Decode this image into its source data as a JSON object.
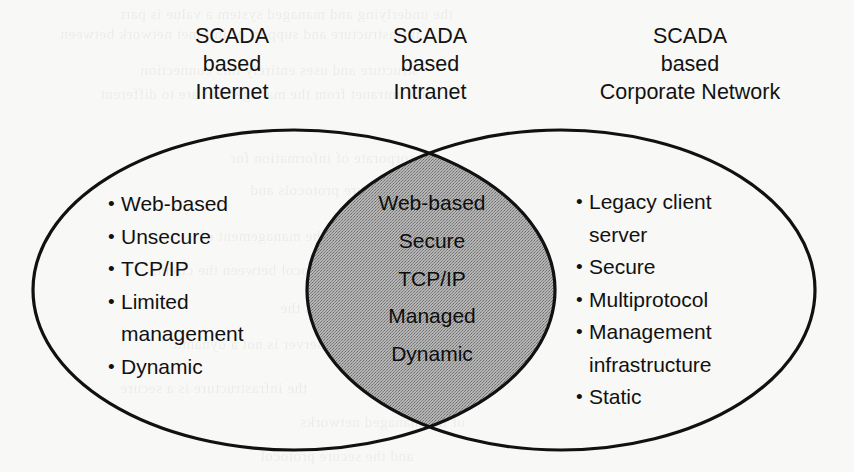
{
  "diagram": {
    "type": "venn",
    "background_color": "#f8f8f6",
    "stroke_color": "#111111",
    "intersection_fill": "#a0a0a0",
    "headers": [
      {
        "id": "left",
        "line1": "SCADA",
        "line2": "based",
        "line3": "Internet"
      },
      {
        "id": "center",
        "line1": "SCADA",
        "line2": "based",
        "line3": "Intranet"
      },
      {
        "id": "right",
        "line1": "SCADA",
        "line2": "based",
        "line3": "Corporate Network"
      }
    ],
    "sets": {
      "left": {
        "name": "SCADA based Internet",
        "bullet": "•",
        "items": [
          "Web-based",
          "Unsecure",
          "TCP/IP",
          "Limited\nmanagement",
          "Dynamic"
        ]
      },
      "intersection": {
        "name": "SCADA based Intranet",
        "items": [
          "Web-based",
          "Secure",
          "TCP/IP",
          "Managed",
          "Dynamic"
        ]
      },
      "right": {
        "name": "SCADA based Corporate Network",
        "bullet": "•",
        "items": [
          "Legacy client\nserver",
          "Secure",
          "Multiprotocol",
          "Management\ninfrastructure",
          "Static"
        ]
      }
    },
    "ghost_text": [
      {
        "text": "the underlying and managed system a value is part",
        "x": 120,
        "y": 6
      },
      {
        "text": "infrastructure and support of intranet network between",
        "x": 60,
        "y": 26
      },
      {
        "text": "structure and uses entirely this connection",
        "x": 140,
        "y": 62
      },
      {
        "text": "the intranet from the management are to different",
        "x": 100,
        "y": 86
      },
      {
        "text": "the corporate of information for",
        "x": 230,
        "y": 150
      },
      {
        "text": "managed secure protocols and",
        "x": 250,
        "y": 182
      },
      {
        "text": "between the management of",
        "x": 200,
        "y": 228
      },
      {
        "text": "protocol between the clients",
        "x": 150,
        "y": 262
      },
      {
        "text": "the static network has the",
        "x": 280,
        "y": 300
      },
      {
        "text": "client server is not a dynamic",
        "x": 170,
        "y": 336
      },
      {
        "text": "the infrastructure is a secure",
        "x": 120,
        "y": 380
      },
      {
        "text": "of the managed networks",
        "x": 300,
        "y": 414
      },
      {
        "text": "and the secure protocol",
        "x": 260,
        "y": 448
      }
    ]
  }
}
